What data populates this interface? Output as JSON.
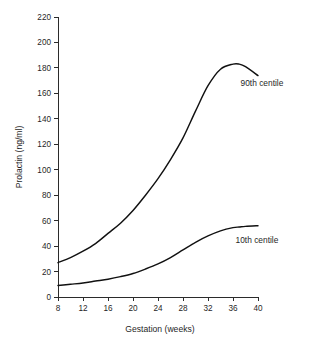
{
  "chart_data": {
    "type": "line",
    "title": "",
    "xlabel": "Gestation (weeks)",
    "ylabel": "Prolactin (ng/ml)",
    "xlim": [
      8,
      40
    ],
    "ylim": [
      0,
      220
    ],
    "xticks": [
      8,
      12,
      16,
      20,
      24,
      28,
      32,
      36,
      40
    ],
    "yticks": [
      0,
      20,
      40,
      60,
      80,
      100,
      120,
      140,
      160,
      180,
      200,
      220
    ],
    "xtick_labels": [
      "8",
      "12",
      "16",
      "20",
      "24",
      "28",
      "32",
      "36",
      "40"
    ],
    "ytick_labels": [
      "0",
      "20",
      "40",
      "60",
      "80",
      "100",
      "120",
      "140",
      "160",
      "180",
      "200",
      "220"
    ],
    "grid": false,
    "legend_position": "inline-right-of-curve",
    "line_color": "#111111",
    "background_color": "#ffffff",
    "x": [
      8,
      10,
      12,
      14,
      16,
      18,
      20,
      22,
      24,
      26,
      28,
      30,
      32,
      34,
      36,
      37,
      38,
      40
    ],
    "series": [
      {
        "name": "90th centile",
        "label": "90th centile",
        "label_x": 37.2,
        "label_y": 168,
        "values": [
          27,
          31,
          36,
          42,
          50,
          58,
          68,
          80,
          93,
          108,
          125,
          146,
          166,
          179,
          183,
          183,
          181,
          174
        ]
      },
      {
        "name": "10th centile",
        "label": "10th centile",
        "label_x": 36.4,
        "label_y": 45,
        "values": [
          9,
          10,
          11,
          12.5,
          14,
          16,
          18.5,
          22,
          26,
          31,
          37,
          43,
          48,
          52,
          54.5,
          55,
          55.5,
          56
        ]
      }
    ],
    "annotations": [
      {
        "name": "90th-centile-label",
        "text": "90th centile"
      },
      {
        "name": "10th-centile-label",
        "text": "10th centile"
      }
    ]
  },
  "axes": {
    "y_title": "Prolactin (ng/ml)",
    "x_title": "Gestation (weeks)"
  }
}
